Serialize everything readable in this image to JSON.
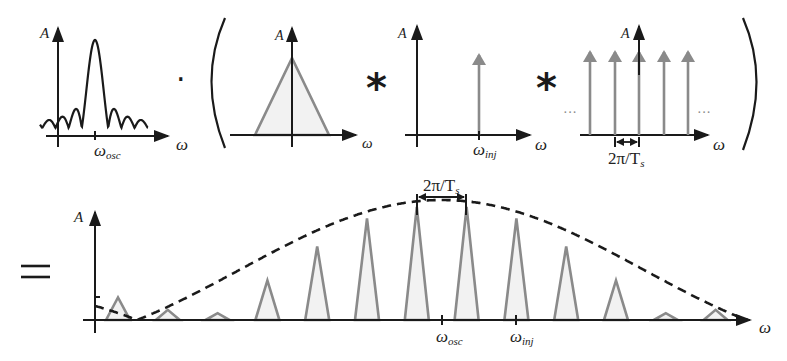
{
  "panels": {
    "sinc": {
      "y_label": "A",
      "x_label": "ω",
      "tick_label": "ω",
      "tick_sub": "osc"
    },
    "triangle": {
      "y_label": "A",
      "x_label": "ω"
    },
    "impulse": {
      "y_label": "A",
      "x_label": "ω",
      "tick_label": "ω",
      "tick_sub": "inj"
    },
    "comb": {
      "y_label": "A",
      "x_label": "ω",
      "spacing_label": "2π/T",
      "spacing_sub": "s",
      "ellipsis": "···"
    },
    "result": {
      "y_label": "A",
      "x_label": "ω",
      "spacing_label": "2π/T",
      "spacing_sub": "s",
      "ticks": [
        {
          "label": "ω",
          "sub": "osc"
        },
        {
          "label": "ω",
          "sub": "inj"
        }
      ],
      "triangle_relative_heights": [
        0.2,
        0.09,
        0.06,
        0.35,
        0.65,
        0.9,
        1.0,
        1.0,
        0.9,
        0.65,
        0.35,
        0.06,
        0.09
      ]
    }
  },
  "operators": {
    "multiply": "·",
    "open_paren": "(",
    "convolve_1": "*",
    "convolve_2": "*",
    "close_paren": ")",
    "equals": "="
  },
  "colors": {
    "axis": "#1a1a1a",
    "spectral_line": "#8a8a8a",
    "fill": "#f2f2f2"
  }
}
